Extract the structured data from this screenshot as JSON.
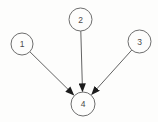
{
  "diagram": {
    "type": "directed-graph",
    "nodes": [
      {
        "id": "1",
        "label": "1"
      },
      {
        "id": "2",
        "label": "2"
      },
      {
        "id": "3",
        "label": "3"
      },
      {
        "id": "4",
        "label": "4"
      }
    ],
    "edges": [
      {
        "from": "1",
        "to": "4"
      },
      {
        "from": "2",
        "to": "4"
      },
      {
        "from": "3",
        "to": "4"
      }
    ]
  },
  "colors": {
    "background": "#fdfdfc",
    "node_fill": "#fdfdfc",
    "node_stroke": "#6e6e6e",
    "edge_stroke": "#636363",
    "arrowhead": "#1c1c1c",
    "label_text": "#4a4a4a"
  }
}
